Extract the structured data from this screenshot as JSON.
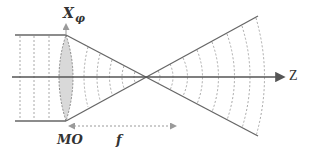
{
  "diagram": {
    "labels": {
      "x_axis_main": "X",
      "x_axis_sub": "φ",
      "z_axis": "Z",
      "objective": "MO",
      "focal_length": "f"
    },
    "colors": {
      "lines": "#666666",
      "dashed": "#9a9a9a",
      "lens_fill": "#d9d9d9",
      "text": "#333333"
    },
    "geometry": {
      "axis_y": 77,
      "beam_top_y": 35,
      "beam_bottom_y": 121,
      "lens_x": 66,
      "focus_x": 146,
      "cone_end_x": 258,
      "cone_top_y": 16,
      "cone_bottom_y": 136
    }
  }
}
